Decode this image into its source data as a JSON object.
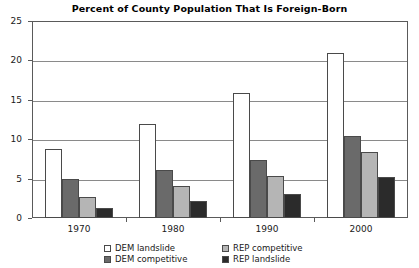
{
  "chart_data": {
    "type": "bar",
    "title": "Percent of County Population That Is Foreign-Born",
    "xlabel": "",
    "ylabel": "",
    "categories": [
      "1970",
      "1980",
      "1990",
      "2000"
    ],
    "ylim": [
      0,
      25
    ],
    "yticks": [
      0,
      5,
      10,
      15,
      20,
      25
    ],
    "ytick_labels": [
      "0",
      "5",
      "10",
      "15",
      "20",
      "25"
    ],
    "grid": true,
    "legend_position": "bottom",
    "series": [
      {
        "name": "DEM landslide",
        "color": "#ffffff",
        "values": [
          8.7,
          11.9,
          15.9,
          20.9
        ]
      },
      {
        "name": "DEM competitive",
        "color": "#6a6a6a",
        "values": [
          5.0,
          6.1,
          7.3,
          10.4
        ]
      },
      {
        "name": "REP competitive",
        "color": "#b5b5b5",
        "values": [
          2.7,
          4.0,
          5.3,
          8.4
        ]
      },
      {
        "name": "REP landslide",
        "color": "#2b2b2b",
        "values": [
          1.3,
          2.2,
          3.0,
          5.2
        ]
      }
    ]
  },
  "legend": {
    "entries": [
      {
        "label": "DEM landslide",
        "color": "#ffffff"
      },
      {
        "label": "REP competitive",
        "color": "#b5b5b5"
      },
      {
        "label": "DEM competitive",
        "color": "#6a6a6a"
      },
      {
        "label": "REP landslide",
        "color": "#2b2b2b"
      }
    ]
  },
  "style": {
    "frame_color": "#5a5a5a",
    "grid_color": "#8a8a8a",
    "bar_outline": "#4a4a4a",
    "background": "#ffffff",
    "text_color": "#1a1a1a"
  }
}
